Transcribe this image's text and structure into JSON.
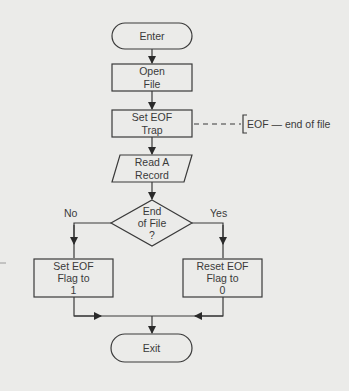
{
  "diagram": {
    "type": "flowchart",
    "colors": {
      "background": "#ebebe9",
      "stroke": "#3a3a3a",
      "text": "#3a3a3a"
    },
    "nodes": {
      "enter": {
        "shape": "terminal",
        "label": "Enter"
      },
      "open_file": {
        "shape": "process",
        "label": "Open\nFile"
      },
      "set_eof_trap": {
        "shape": "process",
        "label": "Set EOF\nTrap"
      },
      "read_record": {
        "shape": "input-output",
        "label": "Read A\nRecord"
      },
      "end_of_file": {
        "shape": "decision",
        "label": "End\nof File\n?"
      },
      "set_flag": {
        "shape": "process",
        "label": "Set EOF\nFlag to\n1"
      },
      "reset_flag": {
        "shape": "process",
        "label": "Reset EOF\nFlag to\n0"
      },
      "exit": {
        "shape": "terminal",
        "label": "Exit"
      }
    },
    "branches": {
      "no": "No",
      "yes": "Yes"
    },
    "annotation": {
      "label": "EOF — end of file",
      "attached_to": "set_eof_trap"
    },
    "edges": [
      {
        "from": "enter",
        "to": "open_file"
      },
      {
        "from": "open_file",
        "to": "set_eof_trap"
      },
      {
        "from": "set_eof_trap",
        "to": "read_record"
      },
      {
        "from": "read_record",
        "to": "end_of_file"
      },
      {
        "from": "end_of_file",
        "to": "set_flag",
        "label": "No"
      },
      {
        "from": "end_of_file",
        "to": "reset_flag",
        "label": "Yes"
      },
      {
        "from": "set_flag",
        "to": "exit"
      },
      {
        "from": "reset_flag",
        "to": "exit"
      }
    ]
  }
}
